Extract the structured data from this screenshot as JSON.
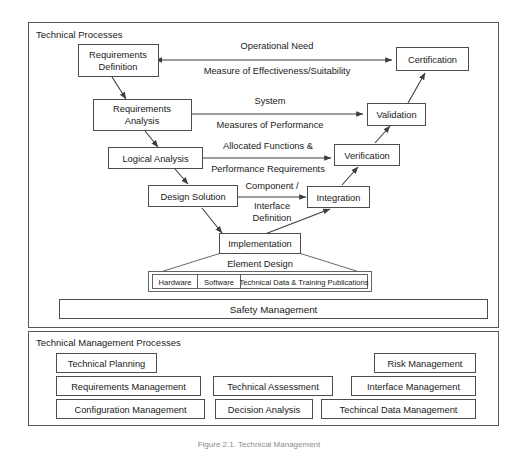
{
  "figure": {
    "caption": "Figure 2.1.  Technical Management"
  },
  "technical_processes": {
    "panel_title": "Technical Processes",
    "nodes": {
      "requirements_definition": "Requirements|Definition",
      "requirements_definition_line1": "Requirements",
      "requirements_definition_line2": "Definition",
      "requirements_analysis_line1": "Requirements",
      "requirements_analysis_line2": "Analysis",
      "logical_analysis": "Logical Analysis",
      "design_solution": "Design Solution",
      "implementation": "Implementation",
      "integration": "Integration",
      "verification": "Verification",
      "validation": "Validation",
      "certification": "Certification"
    },
    "edge_labels": {
      "operational_need": "Operational Need",
      "measure_of_effectiveness": "Measure of Effectiveness/Suitability",
      "system": "System",
      "measures_of_performance": "Measures of Performance",
      "allocated_functions": "Allocated Functions &",
      "performance_requirements": "Performance Requirements",
      "component": "Component /",
      "interface": "Interface",
      "definition": "Definition"
    },
    "element_design": {
      "label": "Element Design",
      "items": [
        "Hardware",
        "Software",
        "Technical Data & Training Publications"
      ]
    },
    "safety_management": "Safety Management"
  },
  "technical_management_processes": {
    "panel_title": "Technical Management Processes",
    "items": [
      "Technical Planning",
      "Risk Management",
      "Requirements Management",
      "Technical Assessment",
      "Interface Management",
      "Configuration Management",
      "Decision Analysis",
      "Techincal Data Management"
    ]
  },
  "colors": {
    "background": "#ffffff",
    "stroke": "#4d4d4f",
    "panel_stroke": "#58585a",
    "text": "#1a1a1a",
    "caption_text": "#8c8c8e"
  }
}
